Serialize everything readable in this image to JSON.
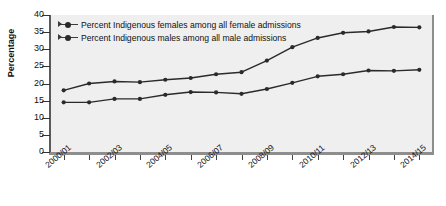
{
  "chart_data": {
    "type": "line",
    "title": "",
    "xlabel": "",
    "ylabel": "Percentage",
    "ylim": [
      0,
      40
    ],
    "ytick_values": [
      0,
      5,
      10,
      15,
      20,
      25,
      30,
      35,
      40
    ],
    "grid": false,
    "legend_position": "top-left",
    "x": [
      "2000/01",
      "2001/02",
      "2002/03",
      "2003/04",
      "2004/05",
      "2005/06",
      "2006/07",
      "2007/08",
      "2008/09",
      "2009/10",
      "2010/11",
      "2011/12",
      "2012/13",
      "2013/14",
      "2014/15"
    ],
    "xtick_labels_shown": [
      "2000/01",
      "2002/03",
      "2004/05",
      "2006/07",
      "2008/09",
      "2010/11",
      "2012/13",
      "2014/15"
    ],
    "series": [
      {
        "name": "Percent Indigenous females among all female admissions",
        "color": "#2a2a2a",
        "values": [
          18.0,
          20.0,
          20.6,
          20.4,
          21.1,
          21.6,
          22.7,
          23.3,
          26.7,
          30.6,
          33.3,
          34.8,
          35.2,
          36.5,
          36.4
        ]
      },
      {
        "name": "Percent Indigenous males among all male admissions",
        "color": "#2a2a2a",
        "values": [
          14.5,
          14.5,
          15.5,
          15.5,
          16.7,
          17.5,
          17.4,
          17.0,
          18.4,
          20.2,
          22.1,
          22.7,
          23.8,
          23.7,
          24.0
        ]
      }
    ]
  },
  "axis": {
    "y_title": "Percentage",
    "y_ticks": [
      "40",
      "35",
      "30",
      "25",
      "20",
      "15",
      "10",
      "5",
      "0"
    ],
    "x_ticks": [
      "2000/01",
      "2002/03",
      "2004/05",
      "2006/07",
      "2008/09",
      "2010/11",
      "2012/13",
      "2014/15"
    ]
  },
  "legend": {
    "items": [
      {
        "label": "Percent Indigenous females among all female admissions"
      },
      {
        "label": "Percent Indigenous males among all male admissions"
      }
    ]
  },
  "colors": {
    "plot_background": "#efefef",
    "line": "#2a2a2a",
    "axis": "#8e8e8e",
    "text": "#111111"
  }
}
